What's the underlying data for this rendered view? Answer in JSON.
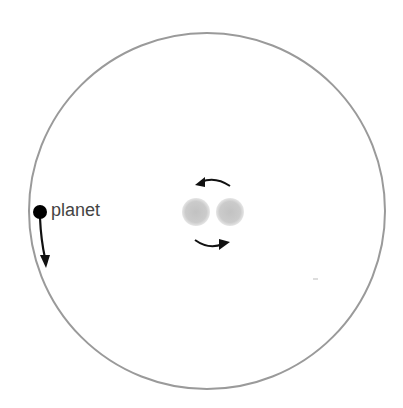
{
  "diagram": {
    "planet_label": "planet",
    "orbit": {
      "cx": 207,
      "cy": 211,
      "r": 178,
      "color": "#9a9a9a"
    },
    "planet": {
      "cx": 40,
      "cy": 212,
      "r": 7,
      "color": "#000000"
    },
    "stars": [
      {
        "cx": 196,
        "cy": 212,
        "r": 14,
        "color": "#c4c4c4"
      },
      {
        "cx": 230,
        "cy": 212,
        "r": 14,
        "color": "#c4c4c4"
      }
    ],
    "arrows": [
      {
        "name": "upper-rotation-arrow",
        "direction": "counter-clockwise"
      },
      {
        "name": "lower-rotation-arrow",
        "direction": "clockwise"
      },
      {
        "name": "planet-motion-arrow",
        "direction": "down"
      }
    ]
  }
}
